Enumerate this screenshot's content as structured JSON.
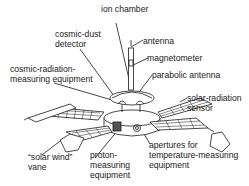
{
  "diagram": {
    "labels": {
      "ion_chamber": "ion chamber",
      "cosmic_dust_detector_1": "cosmic-dust",
      "cosmic_dust_detector_2": "detector",
      "antenna": "antenna",
      "magnetometer": "magnetometer",
      "cosmic_radiation_1": "cosmic-radiation-",
      "cosmic_radiation_2": "measuring equipment",
      "parabolic_antenna": "parabolic antenna",
      "solar_radiation_1": "solar-radiation",
      "solar_radiation_2": "sensor",
      "solar_wind_1": "“solar wind”",
      "solar_wind_2": "vane",
      "proton_1": "proton-",
      "proton_2": "measuring",
      "proton_3": "equipment",
      "apertures_1": "apertures for",
      "apertures_2": "temperature-measuring",
      "apertures_3": "equipment"
    },
    "colors": {
      "line": "#1a1a1a",
      "background": "#ffffff"
    }
  }
}
